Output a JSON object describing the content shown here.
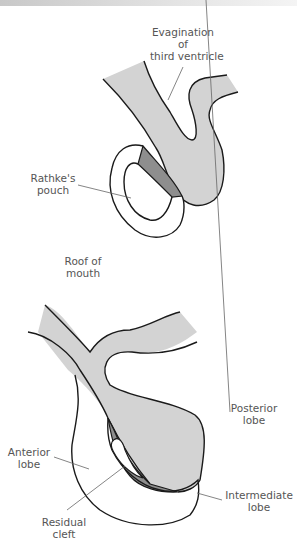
{
  "colors": {
    "neural_tissue": "#d3d3d3",
    "intermediate_tissue": "#8e8e8e",
    "outline": "#1a1a1a",
    "label_text": "#555555",
    "leader_line": "#666666"
  },
  "top_figure": {
    "labels": {
      "evagination_line1": "Evagination",
      "evagination_line2": "of",
      "evagination_line3": "third ventricle",
      "rathke_line1": "Rathke's",
      "rathke_line2": "pouch",
      "roof_line1": "Roof of",
      "roof_line2": "mouth"
    }
  },
  "bottom_figure": {
    "labels": {
      "posterior_line1": "Posterior",
      "posterior_line2": "lobe",
      "anterior_line1": "Anterior",
      "anterior_line2": "lobe",
      "intermediate_line1": "Intermediate",
      "intermediate_line2": "lobe",
      "residual_line1": "Residual",
      "residual_line2": "cleft"
    }
  }
}
